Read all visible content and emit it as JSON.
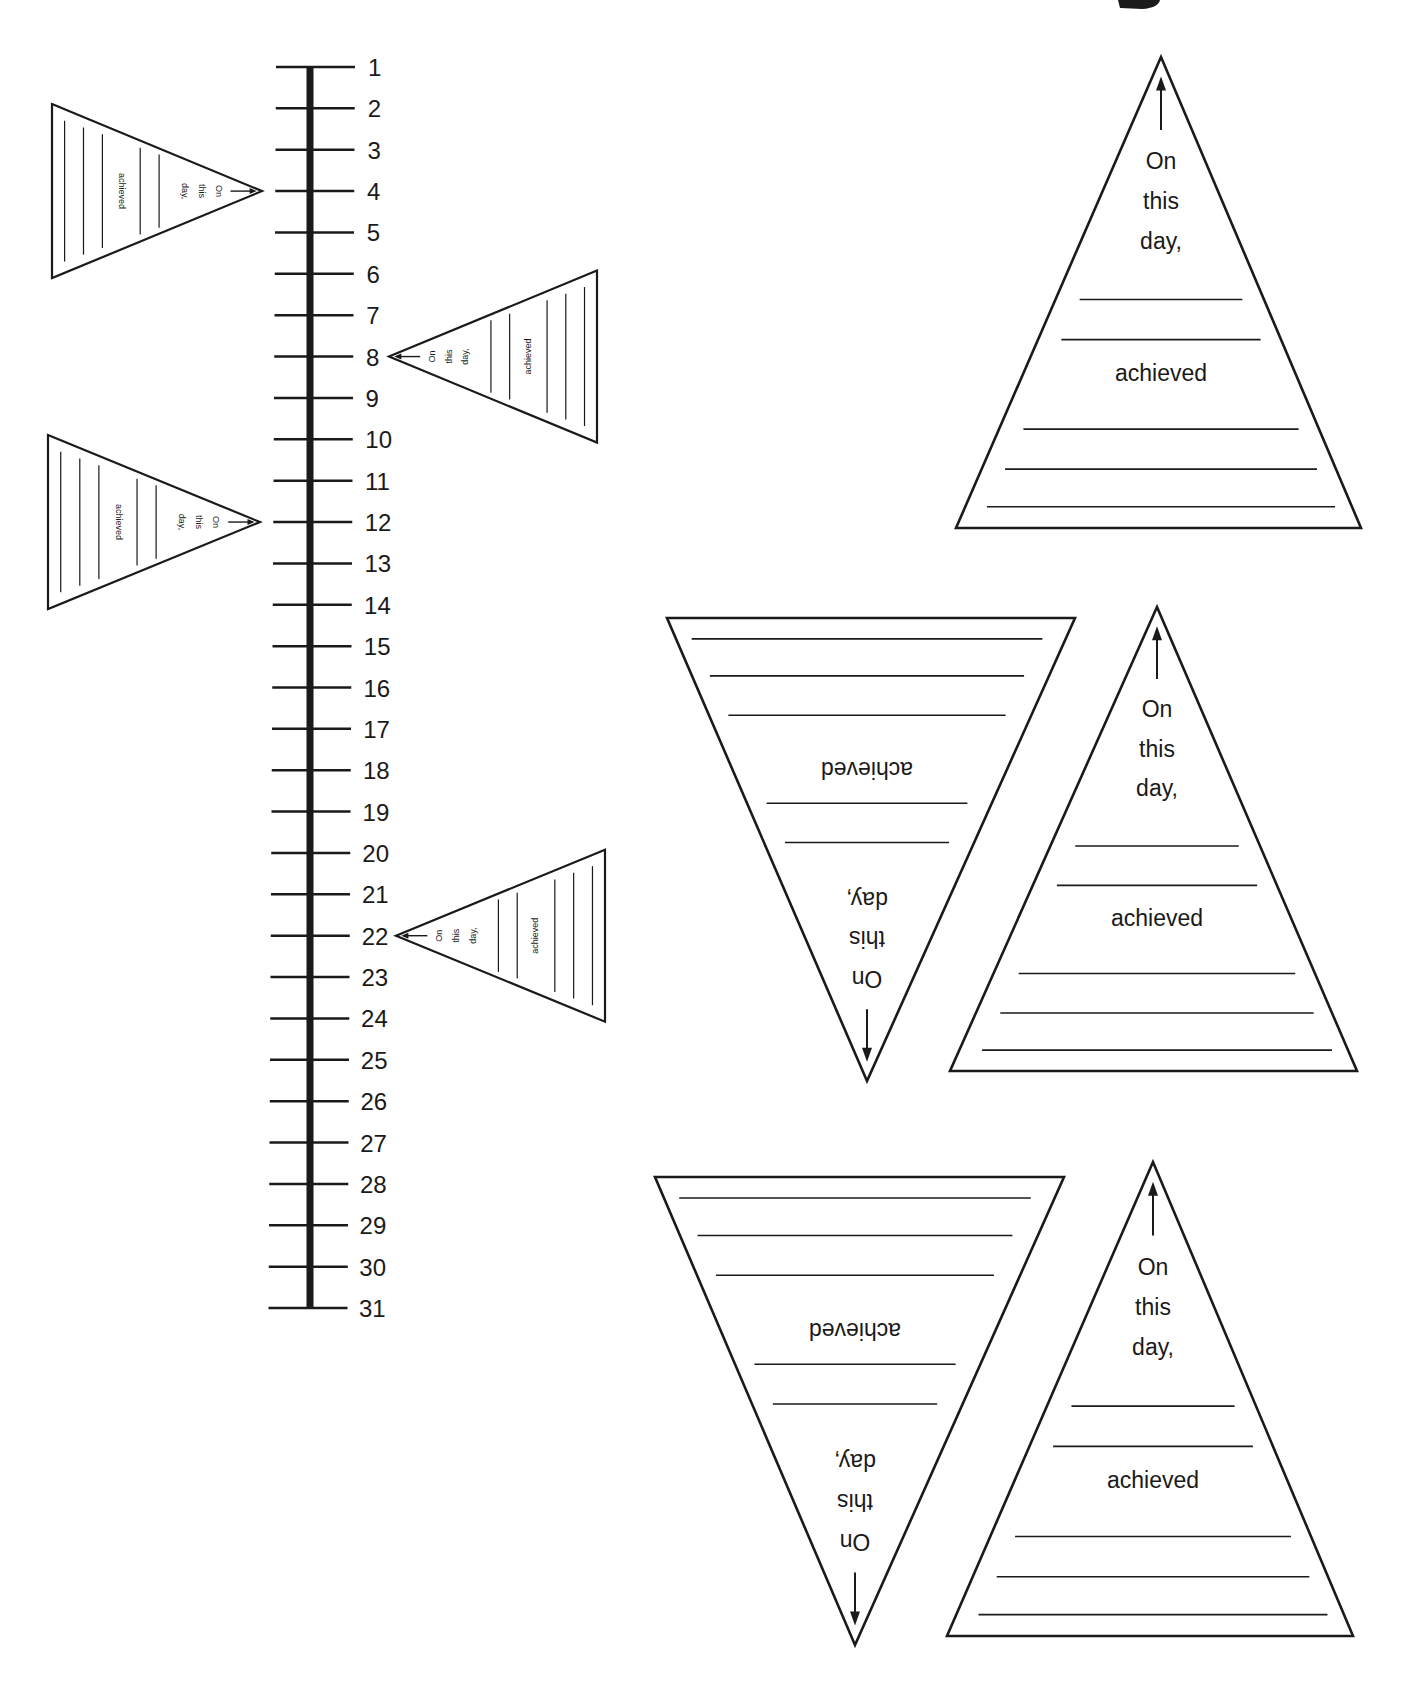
{
  "worksheet": {
    "type": "printable-template",
    "description": "Month timeline with pennant flags"
  },
  "timeline": {
    "ticks": [
      "1",
      "2",
      "3",
      "4",
      "5",
      "6",
      "7",
      "8",
      "9",
      "10",
      "11",
      "12",
      "13",
      "14",
      "15",
      "16",
      "17",
      "18",
      "19",
      "20",
      "21",
      "22",
      "23",
      "24",
      "25",
      "26",
      "27",
      "28",
      "29",
      "30",
      "31"
    ],
    "attached_flags": [
      {
        "day": "4",
        "side": "left"
      },
      {
        "day": "8",
        "side": "right"
      },
      {
        "day": "12",
        "side": "left"
      },
      {
        "day": "22",
        "side": "right"
      }
    ]
  },
  "pennant": {
    "line1": "On",
    "line2": "this",
    "line3": "day,",
    "line4": "achieved",
    "arrow_icon": "arrow-icon"
  },
  "cutout_pennants": [
    {
      "id": "pennant-1",
      "orientation": "up"
    },
    {
      "id": "pennant-2",
      "orientation": "down"
    },
    {
      "id": "pennant-3",
      "orientation": "up"
    },
    {
      "id": "pennant-4",
      "orientation": "down"
    },
    {
      "id": "pennant-5",
      "orientation": "up"
    }
  ],
  "colors": {
    "ink": "#1a1a1a",
    "paper": "#ffffff"
  }
}
